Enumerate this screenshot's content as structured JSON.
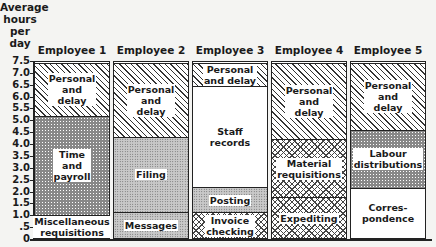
{
  "chart_data": {
    "type": "bar",
    "stacked": true,
    "title": "",
    "ylabel": "Average hours per day",
    "xlabel": "",
    "ylim": [
      0,
      7.5
    ],
    "yticks": [
      "7.5",
      "7.0",
      "6.5",
      "6.0",
      "5.5",
      "5.0",
      "4.5",
      "4.0",
      "3.5",
      "3.0",
      "2.5",
      "2.0",
      "1.5",
      "1.0",
      ".5",
      "0"
    ],
    "categories": [
      "Employee 1",
      "Employee 2",
      "Employee 3",
      "Employee 4",
      "Employee 5"
    ],
    "bars": [
      {
        "name": "Employee 1",
        "segments": [
          {
            "label": "Miscellaneous\nrequisitions",
            "value": 1.0,
            "pattern": "cross"
          },
          {
            "label": "Time\nand\npayroll",
            "value": 4.25,
            "pattern": "dense"
          },
          {
            "label": "Personal\nand\ndelay",
            "value": 2.25,
            "pattern": "diag"
          }
        ]
      },
      {
        "name": "Employee 2",
        "segments": [
          {
            "label": "Messages",
            "value": 1.1,
            "pattern": "dots"
          },
          {
            "label": "Filing",
            "value": 3.25,
            "pattern": "dots"
          },
          {
            "label": "Personal\nand\ndelay",
            "value": 3.15,
            "pattern": "diag"
          }
        ]
      },
      {
        "name": "Employee 3",
        "segments": [
          {
            "label": "Invoice\nchecking",
            "value": 1.1,
            "pattern": "cross"
          },
          {
            "label": "Posting",
            "value": 1.1,
            "pattern": "dots"
          },
          {
            "label": "Staff\nrecords",
            "value": 4.3,
            "pattern": "blank"
          },
          {
            "label": "Personal\nand delay",
            "value": 1.0,
            "pattern": "diag"
          }
        ]
      },
      {
        "name": "Employee 4",
        "segments": [
          {
            "label": "Expediting",
            "value": 1.75,
            "pattern": "cross"
          },
          {
            "label": "Material\nrequisitions",
            "value": 2.5,
            "pattern": "cross"
          },
          {
            "label": "Personal\nand\ndelay",
            "value": 3.25,
            "pattern": "diag"
          }
        ]
      },
      {
        "name": "Employee 5",
        "segments": [
          {
            "label": "Corres-\npondence",
            "value": 2.15,
            "pattern": "blank"
          },
          {
            "label": "Labour\ndistributions",
            "value": 2.5,
            "pattern": "dense"
          },
          {
            "label": "Personal\nand\ndelay",
            "value": 2.85,
            "pattern": "diag"
          }
        ]
      }
    ],
    "grid": false,
    "legend": "none (labels inside segments)"
  },
  "ylabel_text": "Average\nhours\nper\nday"
}
